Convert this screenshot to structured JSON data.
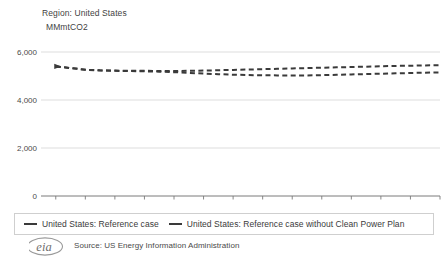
{
  "header": {
    "region_label": "Region: United States",
    "unit_label": "MMmtCO2"
  },
  "legend": {
    "items": [
      {
        "label": "United States: Reference case",
        "color": "#3a3a3a"
      },
      {
        "label": "United States: Reference case without Clean Power Plan",
        "color": "#3a3a3a"
      }
    ]
  },
  "footer": {
    "source": "Source: US Energy Information Administration",
    "logo_text": "eia"
  },
  "chart_data": {
    "type": "line",
    "title": "",
    "subtitle": "Region: United States",
    "xlabel": "",
    "ylabel": "MMmtCO2",
    "ylim": [
      0,
      6000
    ],
    "xlim": [
      2013,
      2040
    ],
    "yticks": [
      0,
      2000,
      4000,
      6000
    ],
    "ytick_labels": [
      "0",
      "2,000",
      "4,000",
      "6,000"
    ],
    "xticks": [
      2014,
      2016,
      2018,
      2020,
      2022,
      2024,
      2026,
      2028,
      2030,
      2032,
      2034,
      2036,
      2038,
      2040
    ],
    "xtick_labels": [
      "2014",
      "2016",
      "2018",
      "2020",
      "2022",
      "2024",
      "2026",
      "2028",
      "2030",
      "2032",
      "2034",
      "2036",
      "2038",
      "2040"
    ],
    "grid": true,
    "grid_axis": "y",
    "legend_position": "bottom",
    "line_style": "dashed",
    "x": [
      2014,
      2015,
      2016,
      2017,
      2018,
      2019,
      2020,
      2021,
      2022,
      2023,
      2024,
      2025,
      2026,
      2027,
      2028,
      2029,
      2030,
      2031,
      2032,
      2033,
      2034,
      2035,
      2036,
      2037,
      2038,
      2039,
      2040
    ],
    "series": [
      {
        "name": "United States: Reference case",
        "color": "#3a3a3a",
        "values": [
          5400,
          5330,
          5260,
          5230,
          5215,
          5205,
          5195,
          5180,
          5160,
          5130,
          5100,
          5075,
          5055,
          5040,
          5030,
          5025,
          5020,
          5025,
          5035,
          5050,
          5065,
          5080,
          5095,
          5110,
          5125,
          5140,
          5150
        ]
      },
      {
        "name": "United States: Reference case without Clean Power Plan",
        "color": "#3a3a3a",
        "values": [
          5400,
          5330,
          5260,
          5235,
          5225,
          5220,
          5215,
          5210,
          5210,
          5215,
          5225,
          5240,
          5255,
          5270,
          5285,
          5300,
          5315,
          5330,
          5345,
          5360,
          5375,
          5390,
          5405,
          5420,
          5430,
          5440,
          5450
        ]
      }
    ]
  }
}
